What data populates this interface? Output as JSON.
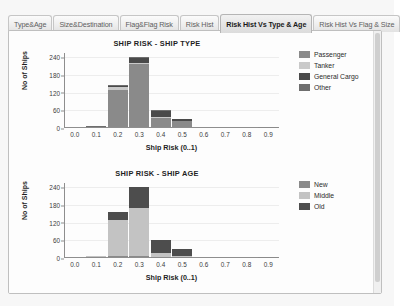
{
  "tabs": [
    {
      "label": "Type&Age",
      "active": false
    },
    {
      "label": "Size&Destination",
      "active": false
    },
    {
      "label": "Flag&Flag Risk",
      "active": false
    },
    {
      "label": "Risk Hist",
      "active": false
    },
    {
      "label": "Risk Hist Vs Type & Age",
      "active": true
    },
    {
      "label": "Risk Hist Vs Flag & Size",
      "active": false
    }
  ],
  "colors": {
    "passenger": "#8a8a8a",
    "tanker": "#c9c9c9",
    "general_cargo": "#4a4a4a",
    "other": "#6e6e6e",
    "new": "#8a8a8a",
    "middle": "#c3c3c3",
    "old": "#4d4d4d",
    "axis": "#8e8e8e",
    "grid": "#ededed",
    "panel": "#ffffff"
  },
  "chart_data": [
    {
      "type": "bar",
      "id": "ship-type",
      "title": "SHIP RISK - SHIP TYPE",
      "xlabel": "Ship Risk (0..1)",
      "ylabel": "No of Ships",
      "stacked": true,
      "categories": [
        "0.0",
        "0.1",
        "0.2",
        "0.3",
        "0.4",
        "0.5",
        "0.6",
        "0.7",
        "0.8",
        "0.9"
      ],
      "xticks": [
        "0.0",
        "0.1",
        "0.2",
        "0.3",
        "0.4",
        "0.5",
        "0.6",
        "0.7",
        "0.8",
        "0.9"
      ],
      "yticks": [
        0,
        60,
        120,
        180,
        240
      ],
      "ylim": [
        0,
        255
      ],
      "grid": true,
      "legend_position": "right",
      "series": [
        {
          "name": "Passenger",
          "color": "#8a8a8a",
          "values": [
            0,
            1,
            127,
            213,
            32,
            20,
            0,
            0,
            0,
            1
          ]
        },
        {
          "name": "Tanker",
          "color": "#c9c9c9",
          "values": [
            0,
            0,
            9,
            4,
            3,
            2,
            0,
            0,
            0,
            0
          ]
        },
        {
          "name": "General Cargo",
          "color": "#4a4a4a",
          "values": [
            0,
            0,
            5,
            18,
            19,
            5,
            0,
            0,
            0,
            0
          ]
        },
        {
          "name": "Other",
          "color": "#6e6e6e",
          "values": [
            0,
            1,
            3,
            3,
            4,
            2,
            0,
            0,
            0,
            0
          ]
        }
      ]
    },
    {
      "type": "bar",
      "id": "ship-age",
      "title": "SHIP RISK - SHIP AGE",
      "xlabel": "Ship Risk (0..1)",
      "ylabel": "No of Ships",
      "stacked": true,
      "categories": [
        "0.0",
        "0.1",
        "0.2",
        "0.3",
        "0.4",
        "0.5",
        "0.6",
        "0.7",
        "0.8",
        "0.9"
      ],
      "xticks": [
        "0.0",
        "0.1",
        "0.2",
        "0.3",
        "0.4",
        "0.5",
        "0.6",
        "0.7",
        "0.8",
        "0.9"
      ],
      "yticks": [
        0,
        60,
        120,
        180,
        240
      ],
      "ylim": [
        0,
        255
      ],
      "grid": true,
      "legend_position": "right",
      "series": [
        {
          "name": "New",
          "color": "#8a8a8a",
          "values": [
            0,
            1,
            4,
            2,
            1,
            1,
            0,
            0,
            0,
            1
          ]
        },
        {
          "name": "Middle",
          "color": "#c3c3c3",
          "values": [
            0,
            1,
            122,
            163,
            12,
            3,
            0,
            0,
            0,
            0
          ]
        },
        {
          "name": "Old",
          "color": "#4d4d4d",
          "values": [
            0,
            0,
            27,
            72,
            44,
            25,
            0,
            0,
            0,
            0
          ]
        }
      ]
    }
  ]
}
